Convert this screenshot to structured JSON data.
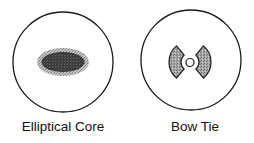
{
  "figure": {
    "panels": [
      {
        "id": "elliptical-core",
        "label": "Elliptical Core",
        "shape": "circle-cladding-with-elliptical-core"
      },
      {
        "id": "bow-tie",
        "label": "Bow Tie",
        "shape": "circle-cladding-with-bow-tie-stress-rods-and-circular-core"
      }
    ]
  },
  "colors": {
    "outline": "#1a1a1a",
    "cladding_fill": "#ffffff",
    "inner_dark": "#3a3a3a",
    "stress_gray": "#9a9a9a"
  }
}
